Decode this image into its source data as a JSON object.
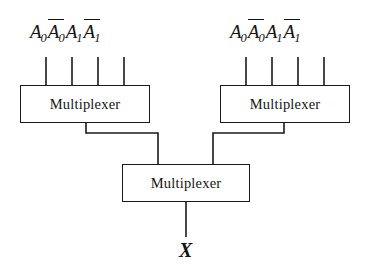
{
  "figure": {
    "background_color": "#ffffff",
    "line_color": "#1a1a1a",
    "text_color": "#141414"
  },
  "blocks": [
    {
      "id": "mux-left",
      "label": "Multiplexer",
      "x": 20,
      "y": 85,
      "width": 130,
      "height": 38
    },
    {
      "id": "mux-right",
      "label": "Multiplexer",
      "x": 220,
      "y": 85,
      "width": 130,
      "height": 38
    },
    {
      "id": "mux-bottom",
      "label": "Multiplexer",
      "x": 122,
      "y": 164,
      "width": 128,
      "height": 38
    }
  ],
  "input_groups": [
    {
      "id": "inputs-left",
      "for_block": "mux-left",
      "signals": [
        {
          "base": "A",
          "sub": "0",
          "overbar": false
        },
        {
          "base": "A",
          "sub": "0",
          "overbar": true
        },
        {
          "base": "A",
          "sub": "1",
          "overbar": false
        },
        {
          "base": "A",
          "sub": "1",
          "overbar": true
        }
      ],
      "stub_x": [
        46,
        72,
        98,
        124
      ],
      "stub_top": 57,
      "label_left": 30,
      "label_baseline_y": 22
    },
    {
      "id": "inputs-right",
      "for_block": "mux-right",
      "signals": [
        {
          "base": "A",
          "sub": "0",
          "overbar": false
        },
        {
          "base": "A",
          "sub": "0",
          "overbar": true
        },
        {
          "base": "A",
          "sub": "1",
          "overbar": false
        },
        {
          "base": "A",
          "sub": "1",
          "overbar": true
        }
      ],
      "stub_x": [
        246,
        272,
        298,
        324
      ],
      "stub_top": 57,
      "label_left": 230,
      "label_baseline_y": 22
    }
  ],
  "output": {
    "id": "output-x",
    "label": "X",
    "wire_x": 186,
    "wire_top": 202,
    "wire_bottom": 237,
    "label_x": 179,
    "label_y": 240
  },
  "interconnects": [
    {
      "id": "wire-left-to-bottom",
      "from_block": "mux-left",
      "to_block": "mux-bottom",
      "points": "86,123 86,133 158,133 158,164"
    },
    {
      "id": "wire-right-to-bottom",
      "from_block": "mux-right",
      "to_block": "mux-bottom",
      "points": "284,123 284,133 213,133 213,164"
    }
  ]
}
